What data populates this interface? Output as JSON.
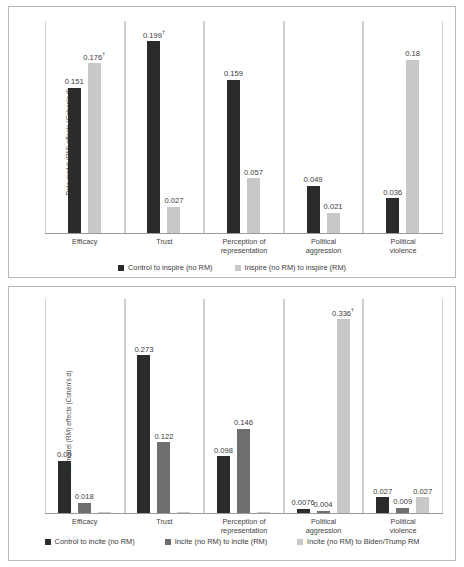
{
  "figure": {
    "ylabel": "Role model (RM) effects (Cohen's d)"
  },
  "chart_data": [
    {
      "type": "bar",
      "title": "",
      "xlabel": "",
      "ylabel": "Role model (RM) effects (Cohen's d)",
      "ylim": [
        0,
        0.22
      ],
      "grid": false,
      "legend_position": "bottom",
      "categories": [
        "Efficacy",
        "Trust",
        "Perception of representation",
        "Political aggression",
        "Political violence"
      ],
      "category_lines": [
        [
          "Efficacy"
        ],
        [
          "Trust"
        ],
        [
          "Perception of",
          "representation"
        ],
        [
          "Political",
          "aggression"
        ],
        [
          "Political",
          "violence"
        ]
      ],
      "series": [
        {
          "name": "Control to inspire (no RM)",
          "color": "#2b2b2b",
          "values": [
            0.151,
            0.199,
            0.159,
            0.049,
            0.036
          ],
          "labels": [
            "0.151",
            "0.199",
            "0.159",
            "0.049",
            "0.036"
          ],
          "marks": [
            "",
            "†",
            "",
            "",
            ""
          ]
        },
        {
          "name": "Inspire (no RM) to inspire (RM)",
          "color": "#c8c8c8",
          "values": [
            0.176,
            0.027,
            0.057,
            0.021,
            0.18
          ],
          "labels": [
            "0.176",
            "0.027",
            "0.057",
            "0.021",
            "0.18"
          ],
          "marks": [
            "†",
            "",
            "",
            "",
            ""
          ]
        }
      ]
    },
    {
      "type": "bar",
      "title": "",
      "xlabel": "",
      "ylabel": "Role model (RM) effects (Cohen's d)",
      "ylim": [
        0,
        0.37
      ],
      "grid": false,
      "legend_position": "bottom",
      "categories": [
        "Efficacy",
        "Trust",
        "Perception of representation",
        "Political aggression",
        "Political violence"
      ],
      "category_lines": [
        [
          "Efficacy"
        ],
        [
          "Trust"
        ],
        [
          "Perception of",
          "representation"
        ],
        [
          "Political",
          "aggression"
        ],
        [
          "Political",
          "violence"
        ]
      ],
      "series": [
        {
          "name": "Control to incite (no RM)",
          "color": "#2b2b2b",
          "values": [
            0.09,
            0.273,
            0.098,
            0.0076,
            0.027
          ],
          "labels": [
            "0.09",
            "0.273",
            "0.098",
            "0.0076",
            "0.027"
          ],
          "marks": [
            "",
            "",
            "",
            "",
            ""
          ]
        },
        {
          "name": "Incite (no RM) to incite (RM)",
          "color": "#6e6e6e",
          "values": [
            0.018,
            0.122,
            0.146,
            0.004,
            0.009
          ],
          "labels": [
            "0.018",
            "0.122",
            "0.146",
            "0.004",
            "0.009"
          ],
          "marks": [
            "",
            "",
            "",
            "",
            ""
          ]
        },
        {
          "name": "Incite (no RM) to Biden/Trump RM",
          "color": "#c8c8c8",
          "values": [
            0,
            0,
            0,
            0.336,
            0.027
          ],
          "labels": [
            "",
            "",
            "",
            "0.336",
            "0.027"
          ],
          "marks": [
            "",
            "",
            "",
            "†",
            ""
          ]
        }
      ]
    }
  ]
}
